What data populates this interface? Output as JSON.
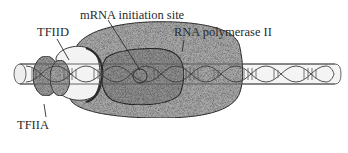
{
  "diagram": {
    "type": "biological-illustration",
    "labels": {
      "mrna_initiation_site": "mRNA initiation site",
      "tfiid": "TFIID",
      "rna_polymerase": "RNA polymerase II",
      "tfiia": "TFIIA"
    },
    "components": [
      {
        "id": "dna",
        "name": "DNA double helix (cylinder)"
      },
      {
        "id": "tfiia",
        "name": "TFIIA"
      },
      {
        "id": "tfiid",
        "name": "TFIID"
      },
      {
        "id": "rna_polymerase",
        "name": "RNA polymerase II"
      },
      {
        "id": "mrna_initiation_site",
        "name": "mRNA initiation site"
      }
    ],
    "colors": {
      "polymerase_fill": "#a9a9a9",
      "polymerase_dark": "#8c8c8c",
      "tfiia_fill": "#9a9a9a",
      "tfiid_fill": "#f2f2f2",
      "dna_fill": "#f4f4f4",
      "outline": "#3a3a3a"
    }
  }
}
